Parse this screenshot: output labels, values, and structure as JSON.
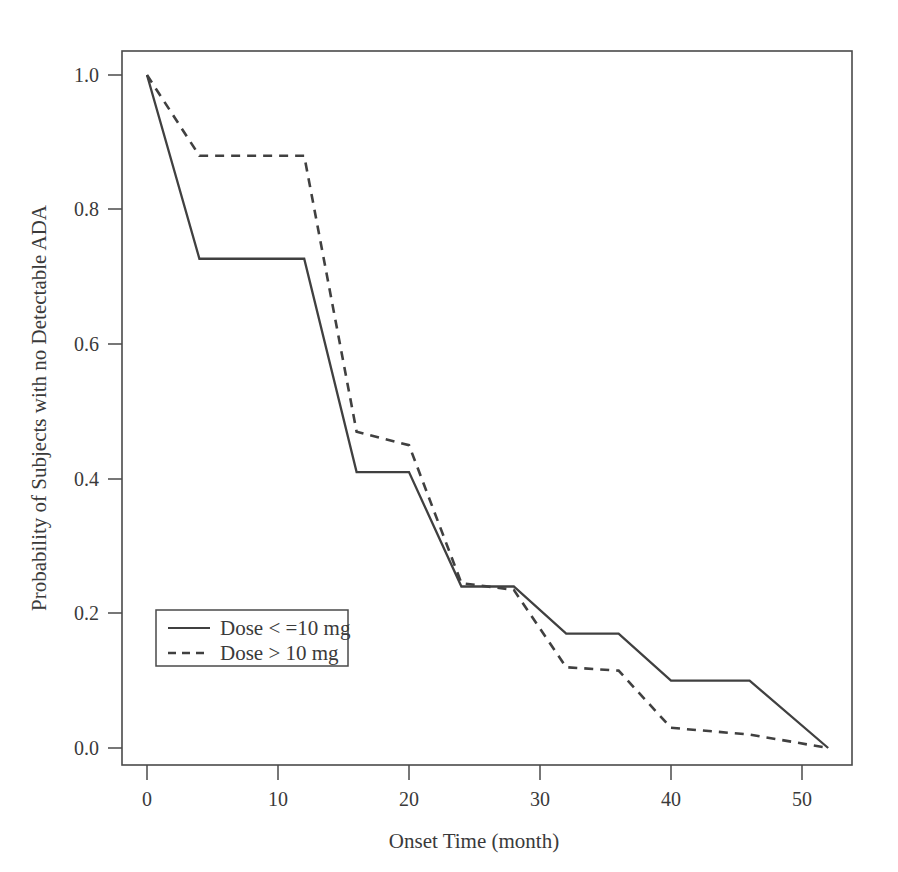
{
  "chart_data": {
    "type": "line",
    "title": "",
    "subtitle": "",
    "xlabel": "Onset Time (month)",
    "ylabel": "Probability of Subjects with no Detectable ADA",
    "xlim": [
      -2,
      55
    ],
    "ylim": [
      -0.04,
      1.06
    ],
    "xticks": [
      0,
      10,
      20,
      30,
      40,
      50
    ],
    "xtick_labels": [
      "0",
      "10",
      "20",
      "30",
      "40",
      "50"
    ],
    "yticks": [
      0.0,
      0.2,
      0.4,
      0.6,
      0.8,
      1.0
    ],
    "ytick_labels": [
      "0.0",
      "0.2",
      "0.4",
      "0.6",
      "0.8",
      "1.0"
    ],
    "grid": false,
    "legend_position": "lower left",
    "series": [
      {
        "name": "Dose < =10 mg",
        "style": "solid",
        "color": "#404040",
        "x": [
          0,
          4,
          12,
          16,
          20,
          24,
          28,
          32,
          36,
          40,
          46,
          52
        ],
        "y": [
          1.0,
          0.727,
          0.727,
          0.41,
          0.41,
          0.24,
          0.24,
          0.17,
          0.17,
          0.1,
          0.1,
          0.0
        ]
      },
      {
        "name": "Dose > 10 mg",
        "style": "dashed",
        "color": "#404040",
        "x": [
          0,
          4,
          12,
          16,
          20,
          24,
          28,
          32,
          36,
          40,
          46,
          52
        ],
        "y": [
          1.0,
          0.88,
          0.88,
          0.47,
          0.45,
          0.245,
          0.235,
          0.12,
          0.115,
          0.03,
          0.02,
          0.0
        ]
      }
    ]
  },
  "legend": {
    "entries": [
      {
        "label": "Dose < =10 mg",
        "style": "solid"
      },
      {
        "label": "Dose > 10 mg",
        "style": "dashed"
      }
    ]
  },
  "axes": {
    "x_title": "Onset Time (month)",
    "y_title": "Probability of Subjects with no Detectable ADA",
    "x_tick_labels": [
      "0",
      "10",
      "20",
      "30",
      "40",
      "50"
    ],
    "y_tick_labels": [
      "1.0",
      "0.8",
      "0.6",
      "0.4",
      "0.2",
      "0.0"
    ]
  },
  "colors": {
    "line": "#404040",
    "frame": "#4a4a4a",
    "text": "#3a3a3a",
    "smudge": "#e9e9e9",
    "background": "#ffffff"
  }
}
